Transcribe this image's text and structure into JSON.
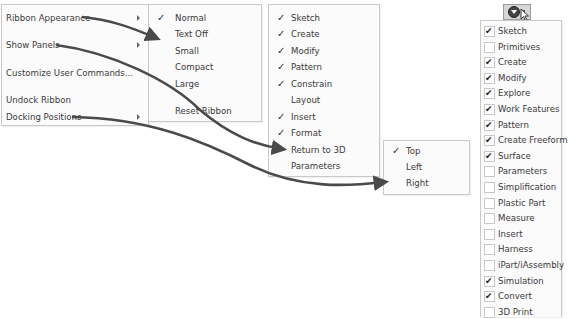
{
  "context_menu": {
    "items": [
      {
        "label": "Ribbon Appearance",
        "has_submenu": true
      },
      {
        "label": "Show Panels",
        "has_submenu": true
      },
      {
        "label": "Customize User Commands...",
        "has_submenu": false
      },
      {
        "label": "Undock Ribbon",
        "has_submenu": false
      },
      {
        "label": "Docking Positions",
        "has_submenu": true
      }
    ]
  },
  "appearance_menu": {
    "items": [
      {
        "label": "Normal",
        "checked": true,
        "check": "✓"
      },
      {
        "label": "Text Off",
        "checked": false
      },
      {
        "label": "Small",
        "checked": false
      },
      {
        "label": "Compact",
        "checked": false
      },
      {
        "label": "Large",
        "checked": false
      },
      {
        "label": "Reset Ribbon",
        "checked": false
      }
    ]
  },
  "panels_menu": {
    "items": [
      {
        "label": "Sketch",
        "checked": true,
        "check": "✓"
      },
      {
        "label": "Create",
        "checked": true,
        "check": "✓"
      },
      {
        "label": "Modify",
        "checked": true,
        "check": "✓"
      },
      {
        "label": "Pattern",
        "checked": true,
        "check": "✓"
      },
      {
        "label": "Constrain",
        "checked": true,
        "check": "✓"
      },
      {
        "label": "Layout",
        "checked": false
      },
      {
        "label": "Insert",
        "checked": true,
        "check": "✓"
      },
      {
        "label": "Format",
        "checked": true,
        "check": "✓"
      },
      {
        "label": "Return to 3D",
        "checked": false
      },
      {
        "label": "Parameters",
        "checked": false
      }
    ]
  },
  "docking_menu": {
    "items": [
      {
        "label": "Top",
        "checked": true,
        "check": "✓"
      },
      {
        "label": "Left",
        "checked": false
      },
      {
        "label": "Right",
        "checked": false
      }
    ]
  },
  "panel_dropdown": {
    "button_icon": "circle-down-arrow-icon",
    "items": [
      {
        "label": "Sketch",
        "checked": true,
        "tick": "✔"
      },
      {
        "label": "Primitives",
        "checked": false
      },
      {
        "label": "Create",
        "checked": true,
        "tick": "✔"
      },
      {
        "label": "Modify",
        "checked": true,
        "tick": "✔"
      },
      {
        "label": "Explore",
        "checked": true,
        "tick": "✔"
      },
      {
        "label": "Work Features",
        "checked": true,
        "tick": "✔"
      },
      {
        "label": "Pattern",
        "checked": true,
        "tick": "✔"
      },
      {
        "label": "Create Freeform",
        "checked": true,
        "tick": "✔"
      },
      {
        "label": "Surface",
        "checked": true,
        "tick": "✔"
      },
      {
        "label": "Parameters",
        "checked": false
      },
      {
        "label": "Simplification",
        "checked": false
      },
      {
        "label": "Plastic Part",
        "checked": false
      },
      {
        "label": "Measure",
        "checked": false
      },
      {
        "label": "Insert",
        "checked": false
      },
      {
        "label": "Harness",
        "checked": false
      },
      {
        "label": "iPart/iAssembly",
        "checked": false
      },
      {
        "label": "Simulation",
        "checked": true,
        "tick": "✔"
      },
      {
        "label": "Convert",
        "checked": true,
        "tick": "✔"
      },
      {
        "label": "3D Print",
        "checked": false
      }
    ]
  },
  "colors": {
    "arrow": "#4a4a4a",
    "panel_border": "#c9c9c9",
    "panel_bg": "#fbfbfb"
  }
}
